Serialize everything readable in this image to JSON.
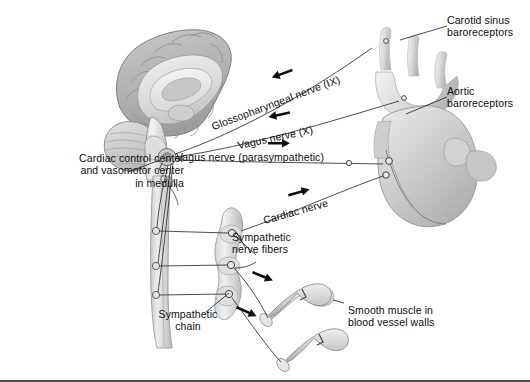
{
  "figure": {
    "background_color": "#ffffff",
    "text_color": "#0d0d0d",
    "line_color": "#3a3a3a"
  },
  "labels": {
    "cardiac_control": "Cardiac control center\nand vasomotor center\nin medulla",
    "glossopharyngeal": "Glossopharyngeal nerve (IX)",
    "vagus_x": "Vagus nerve (X)",
    "vagus_parasympathetic": "Vagus nerve (parasympathetic)",
    "cardiac_nerve": "Cardiac nerve",
    "sympathetic_fibers": "Sympathetic\nnerve fibers",
    "sympathetic_chain": "Sympathetic\nchain",
    "smooth_muscle": "Smooth muscle in\nblood vessel walls",
    "carotid_sinus": "Carotid sinus\nbaroreceptors",
    "aortic": "Aortic\nbaroreceptors"
  },
  "structures": {
    "brain": "mid-sagittal brain with cerebrum, corpus callosum, cerebellum and brainstem",
    "spinal_cord": "spinal cord descending from medulla",
    "sympathetic_chain_ganglia": "chain of three paravertebral ganglia",
    "heart": "heart with aortic arch and great vessels",
    "blood_vessels": "two branching arterioles with smooth muscle",
    "carotid_arteries": "common carotid arteries branching from aortic arch"
  },
  "flow_arrows": [
    {
      "name": "glossopharyngeal-afferent",
      "direction": "left",
      "meaning": "sensory toward medulla"
    },
    {
      "name": "vagus-afferent",
      "direction": "left",
      "meaning": "sensory toward medulla"
    },
    {
      "name": "vagus-efferent",
      "direction": "right",
      "meaning": "parasympathetic to heart"
    },
    {
      "name": "cardiac-nerve-efferent",
      "direction": "right",
      "meaning": "sympathetic to heart"
    },
    {
      "name": "sympathetic-vessel-upper",
      "direction": "right",
      "meaning": "sympathetic to vessel"
    },
    {
      "name": "sympathetic-vessel-lower",
      "direction": "right",
      "meaning": "sympathetic to vessel"
    }
  ]
}
